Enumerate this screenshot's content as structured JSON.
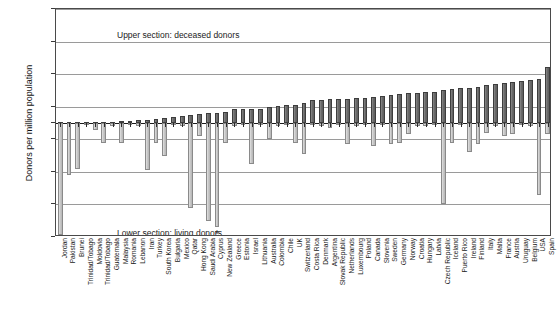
{
  "chart_data": {
    "type": "bar",
    "title": "",
    "xlabel": "",
    "ylabel": "Donors per million population",
    "ylim": [
      -35,
      35
    ],
    "yticks": [
      35,
      25,
      15,
      5,
      0,
      5,
      15,
      25,
      35
    ],
    "ytick_values": [
      35,
      25,
      15,
      5,
      0,
      -5,
      -15,
      -25,
      -35
    ],
    "grid": true,
    "legend_position": "none",
    "annotations": [
      {
        "text": "Upper section:  deceased donors",
        "position": "upper-left"
      },
      {
        "text": "Lower section:  living donors",
        "position": "lower-left"
      },
      {
        "text": "*",
        "position": "below-cyprus-bar"
      }
    ],
    "categories": [
      "Jordan",
      "Pakistan",
      "Brunei",
      "Trinidad/Tobago",
      "Moldovia",
      "Trinidad/Tobago",
      "Guatemala",
      "Malaysia",
      "Romania",
      "Lebanon",
      "Iran",
      "Turkey",
      "South Korea",
      "Bulgaria",
      "Mexico",
      "Qatar",
      "Hong Kong",
      "Saudi Arabia",
      "Cyprus",
      "New Zealand",
      "Greece",
      "Estonia",
      "Israel",
      "Lithuania",
      "Australia",
      "Colombia",
      "Chile",
      "UK",
      "Switzerland",
      "Costa Rica",
      "Denmark",
      "Argentina",
      "Slovak Republic",
      "Netherlands",
      "Luxembourg",
      "Poland",
      "Canada",
      "Slovenia",
      "Sweden",
      "Germany",
      "Norway",
      "Croatia",
      "Hungary",
      "Latvia",
      "Czech Republic",
      "Iceland",
      "Puerto Rico",
      "Ireland",
      "Finland",
      "Italy",
      "Malta",
      "France",
      "Austria",
      "Uruguay",
      "Belgium",
      "USA",
      "Spain"
    ],
    "series": [
      {
        "name": "deceased donors",
        "values": [
          0.1,
          0.1,
          0.2,
          0.2,
          0.3,
          0.3,
          0.4,
          0.5,
          0.6,
          0.8,
          1.0,
          1.3,
          1.6,
          1.8,
          2.2,
          2.5,
          2.8,
          3.0,
          3.2,
          3.4,
          4.2,
          4.3,
          4.4,
          4.4,
          4.8,
          5.2,
          5.4,
          5.6,
          6.2,
          7.2,
          7.2,
          7.3,
          7.4,
          7.5,
          7.6,
          7.7,
          7.9,
          8.2,
          8.5,
          8.8,
          9.1,
          9.2,
          9.4,
          9.5,
          10.2,
          10.3,
          10.6,
          10.7,
          10.9,
          11.6,
          12.0,
          12.2,
          12.6,
          13.0,
          13.2,
          13.4,
          17.2
        ]
      },
      {
        "name": "living donors",
        "values": [
          -34.5,
          -16.0,
          -14.0,
          -0.6,
          -2.0,
          -6.0,
          -0.8,
          -6.2,
          -0.5,
          -1.0,
          -14.5,
          -6.0,
          -10.0,
          -0.5,
          -1.0,
          -26.0,
          -4.0,
          -30.0,
          -32.0,
          -6.0,
          -1.0,
          -0.5,
          -12.5,
          -0.5,
          -5.0,
          -1.0,
          -0.5,
          -6.0,
          -9.5,
          -0.5,
          -1.0,
          -1.5,
          -0.5,
          -6.5,
          -1.0,
          -0.5,
          -7.0,
          -0.5,
          -6.5,
          -6.0,
          -3.5,
          -1.0,
          -1.0,
          -0.5,
          -25.0,
          -6.0,
          -0.5,
          -9.0,
          -6.5,
          -3.0,
          -1.0,
          -4.0,
          -3.5,
          -0.5,
          -1.0,
          -22.0,
          -3.5
        ]
      }
    ]
  },
  "caption": ""
}
